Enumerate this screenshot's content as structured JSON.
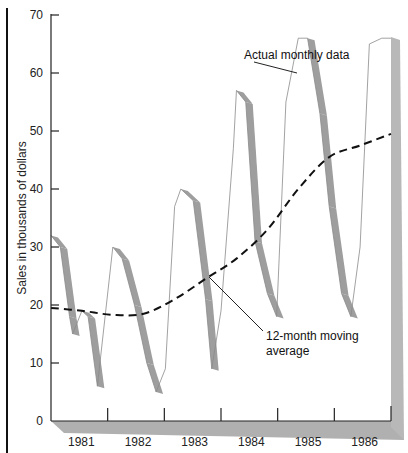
{
  "chart_data": {
    "type": "line",
    "title": "",
    "xlabel": "",
    "ylabel": "Sales in thousands of dollars",
    "ylim": [
      0,
      70
    ],
    "yticks": [
      0,
      10,
      20,
      30,
      40,
      50,
      60,
      70
    ],
    "xtick_labels": [
      "1981",
      "1982",
      "1983",
      "1984",
      "1985",
      "1986"
    ],
    "grid": false,
    "legend": "none (direct annotations)",
    "annotations": [
      {
        "text": "Actual monthly data",
        "points_to": "Actual monthly data series (1985 rise)"
      },
      {
        "text": "12-month moving average",
        "points_to": "dashed moving-average line (~1983)"
      }
    ],
    "series": [
      {
        "name": "Actual monthly data",
        "style": "thin outline with gray shaded ribbon on declining segments",
        "x": [
          1981.0,
          1981.15,
          1981.3,
          1981.35,
          1981.5,
          1981.6,
          1981.75,
          1982.0,
          1982.15,
          1982.35,
          1982.55,
          1982.7,
          1982.85,
          1983.0,
          1983.1,
          1983.3,
          1983.5,
          1983.6,
          1983.75,
          1983.95,
          1984.0,
          1984.15,
          1984.3,
          1984.5,
          1984.65,
          1984.8,
          1985.0,
          1985.15,
          1985.35,
          1985.5,
          1985.7,
          1985.85,
          1986.0,
          1986.15,
          1986.35,
          1986.5
        ],
        "values": [
          32,
          30,
          18,
          15,
          19,
          18,
          6,
          30,
          28,
          20,
          10,
          5,
          9,
          37,
          40,
          38,
          21,
          9,
          19,
          47,
          57,
          55,
          31,
          22,
          18,
          55,
          66,
          66,
          53,
          37,
          22,
          18,
          30,
          65,
          66,
          66
        ]
      },
      {
        "name": "12-month moving average",
        "style": "dashed black",
        "x": [
          1981.0,
          1981.5,
          1982.0,
          1982.5,
          1983.0,
          1983.5,
          1984.0,
          1984.5,
          1985.0,
          1985.5,
          1986.0,
          1986.5
        ],
        "values": [
          19.5,
          19,
          18.3,
          18.5,
          21,
          24.5,
          28,
          33,
          40,
          45.5,
          47.5,
          49.5
        ]
      }
    ]
  },
  "labels": {
    "ylabel": "Sales in thousands of dollars",
    "annotation_actual": "Actual monthly data",
    "annotation_avg_line1": "12-month moving",
    "annotation_avg_line2": "average"
  }
}
